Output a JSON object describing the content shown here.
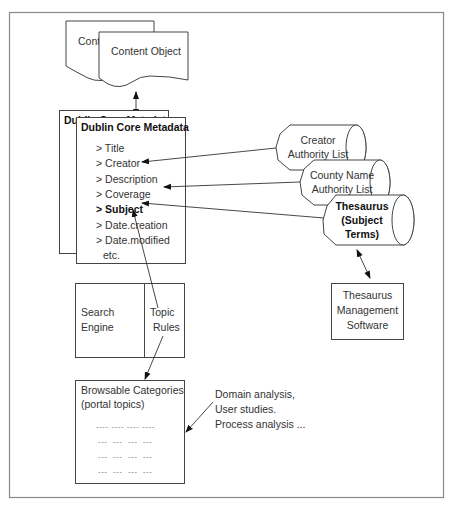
{
  "content_objects": {
    "back_label": "Content Object",
    "front_label": "Content Object"
  },
  "metadata": {
    "back_title": "Dublin Core Metadata",
    "title": "Dublin Core Metadata",
    "fields": [
      {
        "label": "> Title",
        "bold": false
      },
      {
        "label": "> Creator",
        "bold": false
      },
      {
        "label": "> Description",
        "bold": false
      },
      {
        "label": "> Coverage",
        "bold": false
      },
      {
        "label": "> Subject",
        "bold": true
      },
      {
        "label": "> Date.creation",
        "bold": false
      },
      {
        "label": "> Date.modified",
        "bold": false
      },
      {
        "label": "etc.",
        "bold": false
      }
    ]
  },
  "authority_sources": {
    "creator": [
      "Creator",
      "Authority List"
    ],
    "county": [
      "County Name",
      "Authority List"
    ],
    "thesaurus": [
      "Thesaurus",
      "(Subject",
      "Terms)"
    ]
  },
  "thesaurus_software": [
    "Thesaurus",
    "Management",
    "Software"
  ],
  "search": {
    "engine": [
      "Search",
      "Engine"
    ],
    "topic_rules": [
      "Topic",
      "Rules"
    ]
  },
  "browsable": {
    "title": [
      "Browsable Categories",
      "(portal topics)"
    ],
    "placeholder_rows": [
      "---- ---- ---- ----",
      "---  ---  ---  ---",
      "---  ---  ---  ---",
      "---  ---  ---  ---"
    ]
  },
  "analysis_note": [
    "Domain analysis,",
    "User studies.",
    "Process analysis ..."
  ]
}
